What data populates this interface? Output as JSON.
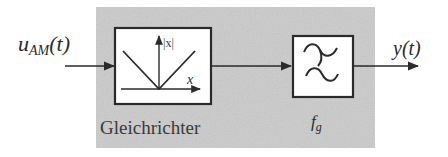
{
  "diagram": {
    "type": "block-diagram",
    "colors": {
      "background_region": "#c9c9c9",
      "block_fill": "#ffffff",
      "stroke": "#2a2a2a",
      "text": "#2a2a2a"
    },
    "input": {
      "label_main": "u",
      "label_sub": "AM",
      "label_arg": "(t)"
    },
    "output": {
      "label_main": "y",
      "label_arg": "(t)"
    },
    "blocks": [
      {
        "id": "rectifier",
        "caption": "Gleichrichter",
        "icon": "absolute-value-graph-icon",
        "y_axis_label": "|x|",
        "x_axis_label": "x"
      },
      {
        "id": "lowpass",
        "caption_main": "f",
        "caption_sub": "g",
        "icon": "lowpass-filter-icon"
      }
    ]
  }
}
